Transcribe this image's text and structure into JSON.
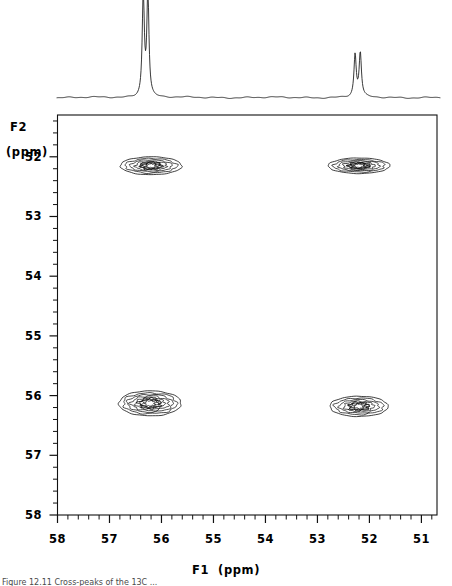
{
  "figure": {
    "kind": "2d-nmr-contour-plot-with-1d-projection",
    "caption_partial": "Figure 12.11  Cross-peaks of the 13C ..."
  },
  "axes": {
    "f2": {
      "label_line1": "F2",
      "label_line2": "(ppm)",
      "ticks": [
        "52",
        "53",
        "54",
        "55",
        "56",
        "57",
        "58"
      ],
      "range": [
        51.3,
        58.0
      ],
      "direction": "decreasing-downward-is-increasing-ppm"
    },
    "f1": {
      "label": "F1  (ppm)",
      "label_name": "F1",
      "label_unit": "(ppm)",
      "ticks": [
        "58",
        "57",
        "56",
        "55",
        "54",
        "53",
        "52",
        "51"
      ],
      "range": [
        58.0,
        50.7
      ],
      "direction": "decreasing-left-to-right"
    }
  },
  "colors": {
    "ink": "#000000",
    "trace": "#222222",
    "frame": "#111111",
    "background": "#ffffff"
  },
  "chart_data": {
    "type": "scatter",
    "title": "",
    "xlabel": "F1  (ppm)",
    "ylabel": "F2 (ppm)",
    "xlim": [
      58.0,
      50.7
    ],
    "ylim": [
      51.3,
      58.0
    ],
    "grid": false,
    "legend": "none",
    "contour_peaks": [
      {
        "name": "cross-peak-top-left",
        "f1": 56.2,
        "f2": 52.15,
        "width_ppm": 1.18,
        "height_ppm": 0.3,
        "rings": 5
      },
      {
        "name": "cross-peak-top-right",
        "f1": 52.2,
        "f2": 52.15,
        "width_ppm": 1.18,
        "height_ppm": 0.26,
        "rings": 5
      },
      {
        "name": "cross-peak-bottom-left",
        "f1": 56.22,
        "f2": 56.13,
        "width_ppm": 1.2,
        "height_ppm": 0.42,
        "rings": 6
      },
      {
        "name": "cross-peak-bottom-right",
        "f1": 52.2,
        "f2": 56.18,
        "width_ppm": 1.12,
        "height_ppm": 0.34,
        "rings": 5
      }
    ],
    "projection_1d": {
      "axis": "F1",
      "peaks": [
        {
          "name": "projection-peak-a",
          "f1": 56.3,
          "relative_height": 1.0,
          "multiplicity": "doublet"
        },
        {
          "name": "projection-peak-b",
          "f1": 52.22,
          "relative_height": 0.42,
          "multiplicity": "doublet"
        }
      ]
    }
  }
}
